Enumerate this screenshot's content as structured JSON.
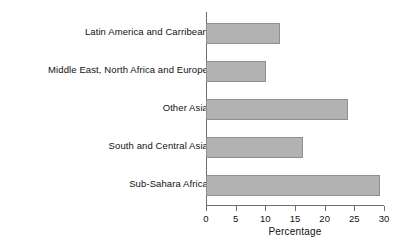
{
  "chart_data": {
    "type": "bar",
    "orientation": "horizontal",
    "title": "",
    "subtitle": "",
    "xlabel": "Percentage",
    "ylabel": "",
    "categories": [
      "Latin America and Carribean",
      "Middle East, North Africa and Europe",
      "Other Asia",
      "South and Central Asia",
      "Sub-Sahara Africa"
    ],
    "values": [
      12.4,
      10.1,
      24.0,
      16.3,
      29.3
    ],
    "xlim": [
      0,
      30
    ],
    "xticks": [
      0,
      5,
      10,
      15,
      20,
      25,
      30
    ],
    "xtick_labels": [
      "0",
      "5",
      "10",
      "15",
      "20",
      "25",
      "30"
    ],
    "grid": false,
    "legend": false,
    "legend_position": "none",
    "bar_color": "#b2b2b2",
    "bar_edge_color": "#8f8f8f",
    "axis_color": "#6d6d6d",
    "text_color": "#111111",
    "background_color": "#ffffff"
  }
}
